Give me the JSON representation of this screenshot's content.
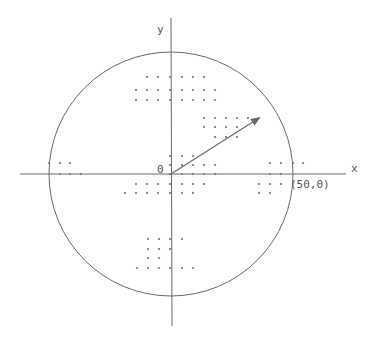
{
  "diagram": {
    "labels": {
      "x_axis": "x",
      "y_axis": "y",
      "origin": "0",
      "point": "(50,0)"
    },
    "colors": {
      "line": "#6a6a6a",
      "dot": "#777777",
      "text": "#555555"
    },
    "geometry": {
      "origin_px": [
        171,
        174
      ],
      "circle_radius_px": 122,
      "circle_radius_units": 50,
      "arrow_from": [
        171,
        174
      ],
      "arrow_to": [
        260,
        118
      ]
    },
    "dot_rows": [
      {
        "y": 77,
        "xs": [
          147,
          158,
          170,
          182,
          193,
          204
        ]
      },
      {
        "y": 90,
        "xs": [
          136,
          147,
          158,
          170,
          182,
          193,
          204,
          215
        ]
      },
      {
        "y": 100,
        "xs": [
          136,
          147,
          158,
          170,
          182,
          193,
          204,
          215
        ]
      },
      {
        "y": 118,
        "xs": [
          204,
          215,
          226,
          237,
          248
        ]
      },
      {
        "y": 127,
        "xs": [
          204,
          215,
          226,
          237
        ]
      },
      {
        "y": 137,
        "xs": [
          215,
          226,
          237
        ]
      },
      {
        "y": 156,
        "xs": [
          170,
          182,
          193
        ]
      },
      {
        "y": 165,
        "xs": [
          170,
          182,
          193,
          204,
          215
        ]
      },
      {
        "y": 174,
        "xs": [
          170,
          182,
          193,
          204,
          215
        ]
      },
      {
        "y": 184,
        "xs": [
          136,
          147,
          158,
          170,
          182,
          193,
          204
        ]
      },
      {
        "y": 193,
        "xs": [
          125,
          136,
          147,
          158,
          170,
          182,
          193
        ]
      },
      {
        "y": 239,
        "xs": [
          148,
          159,
          170,
          182
        ]
      },
      {
        "y": 249,
        "xs": [
          148,
          159,
          170
        ]
      },
      {
        "y": 258,
        "xs": [
          148,
          159
        ]
      },
      {
        "y": 268,
        "xs": [
          137,
          148,
          159,
          170,
          182,
          193
        ]
      },
      {
        "y": 163,
        "xs": [
          49,
          60,
          70,
          270,
          281,
          293,
          303
        ]
      },
      {
        "y": 174,
        "xs": [
          60,
          70,
          81,
          270,
          281
        ]
      },
      {
        "y": 184,
        "xs": [
          259,
          270,
          281
        ]
      },
      {
        "y": 193,
        "xs": [
          259,
          270
        ]
      }
    ]
  }
}
